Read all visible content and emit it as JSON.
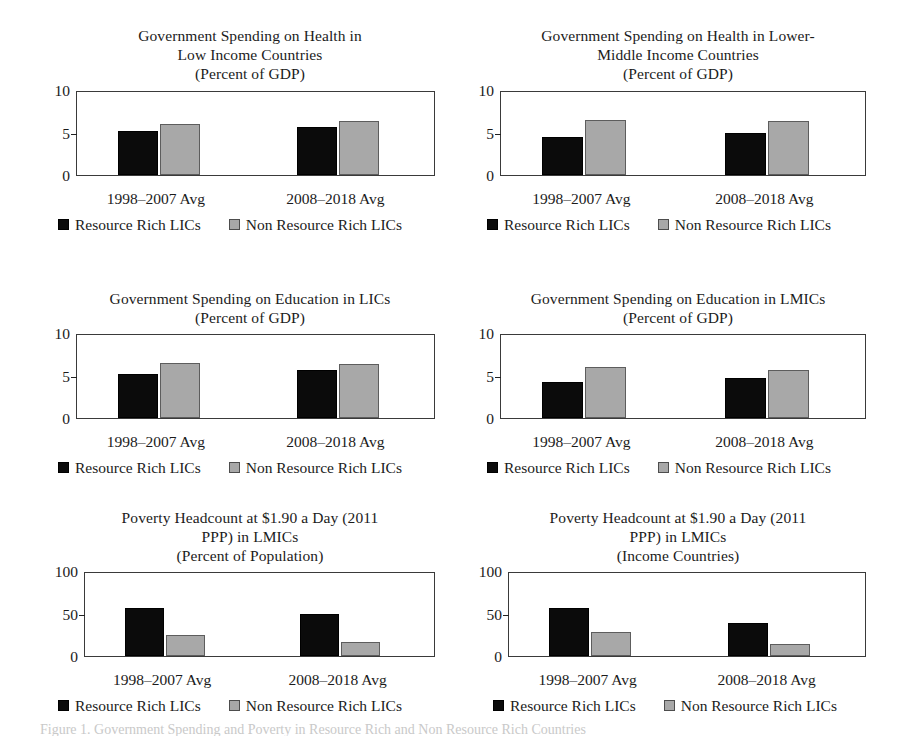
{
  "figure": {
    "background_color": "#ffffff",
    "series_colors": {
      "resource_rich": "#0b0b0b",
      "non_resource_rich": "#a8a8a8"
    },
    "caption": "Figure 1. Government Spending and Poverty in Resource Rich and Non Resource Rich Countries"
  },
  "legend": {
    "dark_label": "Resource Rich LICs",
    "light_label": "Non Resource Rich LICs",
    "dark_swatch_icon": "filled-square-black-icon",
    "light_swatch_icon": "filled-square-gray-icon"
  },
  "chart_data": [
    {
      "id": "health-lic",
      "type": "bar",
      "title": "Government Spending on Health in\nLow Income Countries",
      "subtitle": "(Percent of GDP)",
      "xlabel": "",
      "ylabel": "",
      "ylim": [
        0,
        10
      ],
      "yticks": [
        "0",
        "5",
        "10"
      ],
      "grid": false,
      "legend_position": "below",
      "categories": [
        "1998–2007 Avg",
        "2008–2018 Avg"
      ],
      "series": [
        {
          "name": "Resource Rich LICs",
          "values": [
            5.2,
            5.7
          ]
        },
        {
          "name": "Non Resource Rich LICs",
          "values": [
            6.0,
            6.3
          ]
        }
      ]
    },
    {
      "id": "health-lmic",
      "type": "bar",
      "title": "Government Spending on Health in Lower-\nMiddle Income Countries",
      "subtitle": "(Percent of GDP)",
      "xlabel": "",
      "ylabel": "",
      "ylim": [
        0,
        10
      ],
      "yticks": [
        "0",
        "5",
        "10"
      ],
      "grid": false,
      "legend_position": "below",
      "categories": [
        "1998–2007 Avg",
        "2008–2018 Avg"
      ],
      "series": [
        {
          "name": "Resource Rich LICs",
          "values": [
            4.5,
            5.0
          ]
        },
        {
          "name": "Non Resource Rich LICs",
          "values": [
            6.5,
            6.3
          ]
        }
      ]
    },
    {
      "id": "education-lic",
      "type": "bar",
      "title": "Government Spending on Education in LICs",
      "subtitle": "(Percent of GDP)",
      "xlabel": "",
      "ylabel": "",
      "ylim": [
        0,
        10
      ],
      "yticks": [
        "0",
        "5",
        "10"
      ],
      "grid": false,
      "legend_position": "below",
      "categories": [
        "1998–2007 Avg",
        "2008–2018 Avg"
      ],
      "series": [
        {
          "name": "Resource Rich LICs",
          "values": [
            5.2,
            5.6
          ]
        },
        {
          "name": "Non Resource Rich LICs",
          "values": [
            6.5,
            6.4
          ]
        }
      ]
    },
    {
      "id": "education-lmic",
      "type": "bar",
      "title": "Government Spending on Education in LMICs",
      "subtitle": "(Percent of GDP)",
      "xlabel": "",
      "ylabel": "",
      "ylim": [
        0,
        10
      ],
      "yticks": [
        "0",
        "5",
        "10"
      ],
      "grid": false,
      "legend_position": "below",
      "categories": [
        "1998–2007 Avg",
        "2008–2018 Avg"
      ],
      "series": [
        {
          "name": "Resource Rich LICs",
          "values": [
            4.2,
            4.7
          ]
        },
        {
          "name": "Non Resource Rich LICs",
          "values": [
            6.0,
            5.7
          ]
        }
      ]
    },
    {
      "id": "poverty-population",
      "type": "bar",
      "title": "Poverty Headcount at $1.90 a Day (2011\nPPP) in LMICs",
      "subtitle": "(Percent of Population)",
      "xlabel": "",
      "ylabel": "",
      "ylim": [
        0,
        100
      ],
      "yticks": [
        "0",
        "50",
        "100"
      ],
      "grid": false,
      "legend_position": "below",
      "categories": [
        "1998–2007 Avg",
        "2008–2018 Avg"
      ],
      "series": [
        {
          "name": "Resource Rich LICs",
          "values": [
            56,
            49
          ]
        },
        {
          "name": "Non Resource Rich LICs",
          "values": [
            25,
            16
          ]
        }
      ]
    },
    {
      "id": "poverty-income",
      "type": "bar",
      "title": "Poverty Headcount at $1.90 a Day (2011\nPPP) in LMICs",
      "subtitle": "(Income Countries)",
      "xlabel": "",
      "ylabel": "",
      "ylim": [
        0,
        100
      ],
      "yticks": [
        "0",
        "50",
        "100"
      ],
      "grid": false,
      "legend_position": "below",
      "categories": [
        "1998–2007 Avg",
        "2008–2018 Avg"
      ],
      "series": [
        {
          "name": "Resource Rich LICs",
          "values": [
            57,
            39
          ]
        },
        {
          "name": "Non Resource Rich LICs",
          "values": [
            28,
            14
          ]
        }
      ]
    }
  ]
}
